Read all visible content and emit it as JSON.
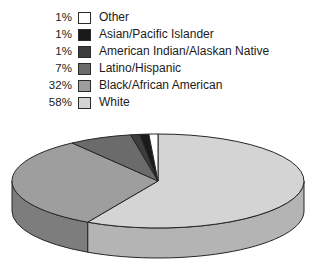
{
  "chart_data": {
    "type": "pie",
    "title": "",
    "subtitle": "",
    "xlabel": "",
    "ylabel": "",
    "legend_position": "top",
    "three_d": true,
    "value_suffix": "%",
    "categories": [
      "Other",
      "Asian/Pacific Islander",
      "American Indian/Alaskan Native",
      "Latino/Hispanic",
      "Black/African American",
      "White"
    ],
    "values": [
      1,
      1,
      1,
      7,
      32,
      58
    ],
    "labels": [
      "1%",
      "1%",
      "1%",
      "7%",
      "32%",
      "58%"
    ],
    "colors": [
      "#ffffff",
      "#1a1a1a",
      "#3d3d3d",
      "#6b6b6b",
      "#9e9e9e",
      "#d4d4d4"
    ],
    "side_colors": [
      "#d8d8d8",
      "#101010",
      "#2c2c2c",
      "#4e4e4e",
      "#7d7d7d",
      "#b4b4b4"
    ],
    "stroke": "#262626",
    "slices": [
      {
        "category": "Other",
        "value": 1,
        "label": "1%",
        "color": "#ffffff"
      },
      {
        "category": "Asian/Pacific Islander",
        "value": 1,
        "label": "1%",
        "color": "#1a1a1a"
      },
      {
        "category": "American Indian/Alaskan Native",
        "value": 1,
        "label": "1%",
        "color": "#3d3d3d"
      },
      {
        "category": "Latino/Hispanic",
        "value": 7,
        "label": "7%",
        "color": "#6b6b6b"
      },
      {
        "category": "Black/African American",
        "value": 32,
        "label": "32%",
        "color": "#9e9e9e"
      },
      {
        "category": "White",
        "value": 58,
        "label": "58%",
        "color": "#d4d4d4"
      }
    ]
  },
  "legend": {
    "rows": [
      {
        "pct": "1%",
        "label": "Other",
        "color": "#ffffff"
      },
      {
        "pct": "1%",
        "label": "Asian/Pacific Islander",
        "color": "#1a1a1a"
      },
      {
        "pct": "1%",
        "label": "American Indian/Alaskan Native",
        "color": "#3d3d3d"
      },
      {
        "pct": "7%",
        "label": "Latino/Hispanic",
        "color": "#6b6b6b"
      },
      {
        "pct": "32%",
        "label": "Black/African American",
        "color": "#9e9e9e"
      },
      {
        "pct": "58%",
        "label": "White",
        "color": "#d4d4d4"
      }
    ]
  },
  "pie_geometry": {
    "cx": 158,
    "cy": 53,
    "rx": 146,
    "ry": 47,
    "depth": 30,
    "start_angle_deg": -90
  }
}
